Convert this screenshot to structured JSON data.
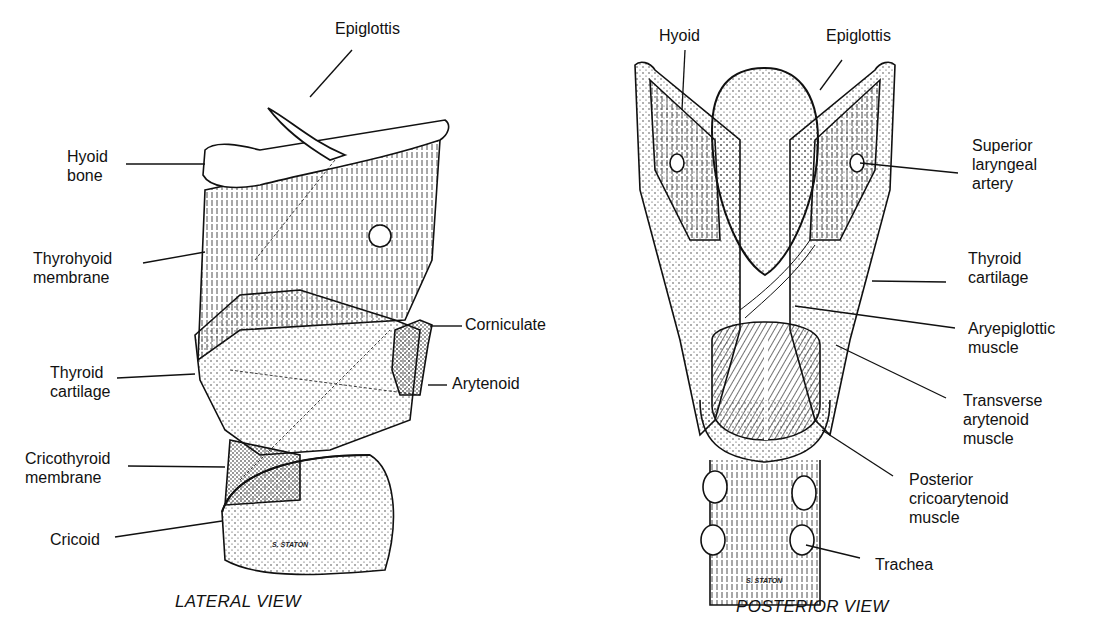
{
  "figure": {
    "lateral": {
      "caption": "LATERAL VIEW",
      "signature": "S. STATON",
      "labels": {
        "epiglottis": "Epiglottis",
        "hyoid_bone": "Hyoid\nbone",
        "thyrohyoid_membrane": "Thyrohyoid\nmembrane",
        "corniculate": "Corniculate",
        "thyroid_cartilage": "Thyroid\ncartilage",
        "arytenoid": "Arytenoid",
        "cricothyroid_membrane": "Cricothyroid\nmembrane",
        "cricoid": "Cricoid"
      }
    },
    "posterior": {
      "caption": "POSTERIOR VIEW",
      "signature": "S. STATON",
      "labels": {
        "hyoid": "Hyoid",
        "epiglottis": "Epiglottis",
        "superior_laryngeal_artery": "Superior\nlaryngeal\nartery",
        "thyroid_cartilage": "Thyroid\ncartilage",
        "aryepiglottic_muscle": "Aryepiglottic\nmuscle",
        "transverse_arytenoid_muscle": "Transverse\narytenoid\nmuscle",
        "posterior_cricoarytenoid_muscle": "Posterior\ncricoarytenoid\nmuscle",
        "trachea": "Trachea"
      }
    }
  }
}
